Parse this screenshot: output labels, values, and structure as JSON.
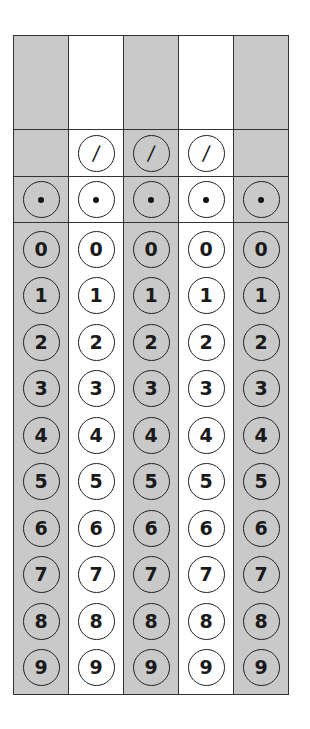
{
  "answer_grid": {
    "columns": [
      {
        "id": 1,
        "shaded": true,
        "write_in": "",
        "has_fraction_bar": false,
        "fraction_symbol": "",
        "decimal_symbol": "."
      },
      {
        "id": 2,
        "shaded": false,
        "write_in": "",
        "has_fraction_bar": true,
        "fraction_symbol": "/",
        "decimal_symbol": "."
      },
      {
        "id": 3,
        "shaded": true,
        "write_in": "",
        "has_fraction_bar": true,
        "fraction_symbol": "/",
        "decimal_symbol": "."
      },
      {
        "id": 4,
        "shaded": false,
        "write_in": "",
        "has_fraction_bar": true,
        "fraction_symbol": "/",
        "decimal_symbol": "."
      },
      {
        "id": 5,
        "shaded": true,
        "write_in": "",
        "has_fraction_bar": false,
        "fraction_symbol": "",
        "decimal_symbol": "."
      }
    ],
    "digits": [
      "0",
      "1",
      "2",
      "3",
      "4",
      "5",
      "6",
      "7",
      "8",
      "9"
    ],
    "colors": {
      "shaded": "#c9c9c9",
      "plain": "#ffffff",
      "border": "#333333"
    }
  }
}
